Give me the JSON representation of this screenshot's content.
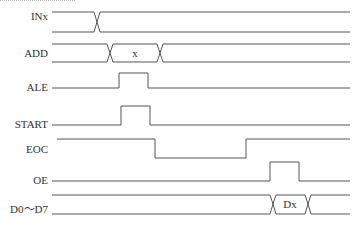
{
  "diagram": {
    "type": "timing-diagram",
    "signals": [
      {
        "name": "INx",
        "kind": "bus",
        "label_y": 16
      },
      {
        "name": "ADD",
        "kind": "bus",
        "label_y": 48,
        "value": "x"
      },
      {
        "name": "ALE",
        "kind": "pulse",
        "label_y": 82
      },
      {
        "name": "START",
        "kind": "pulse",
        "label_y": 119
      },
      {
        "name": "EOC",
        "kind": "step-low",
        "label_y": 144
      },
      {
        "name": "OE",
        "kind": "pulse",
        "label_y": 175
      },
      {
        "name": "D0～D7",
        "kind": "bus",
        "label_y": 204,
        "value": "Dx"
      }
    ],
    "labels": {
      "inx": "INx",
      "add": "ADD",
      "ale": "ALE",
      "start": "START",
      "eoc": "EOC",
      "oe": "OE",
      "data": "D0～D7",
      "add_value": "x",
      "data_value": "Dx"
    },
    "stroke_color": "#555555"
  }
}
